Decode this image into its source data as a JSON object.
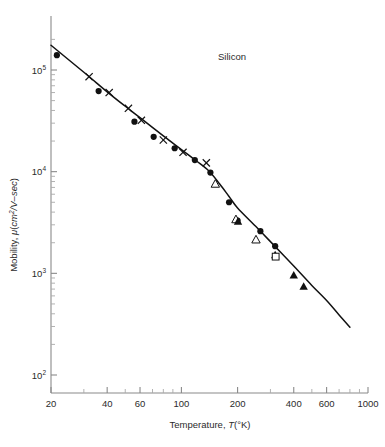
{
  "chart_data": {
    "type": "scatter",
    "title": "",
    "annotation": "Silicon",
    "xlabel": "Temperature, T(°K)",
    "ylabel": "Mobility, μ(cm²/V–sec)",
    "xscale": "log",
    "yscale": "log",
    "xlim": [
      20,
      1000
    ],
    "ylim": [
      100,
      200000
    ],
    "grid": false,
    "legend": "none",
    "xticks": [
      {
        "value": 20,
        "label": "20"
      },
      {
        "value": 40,
        "label": "40"
      },
      {
        "value": 60,
        "label": "60"
      },
      {
        "value": 100,
        "label": "100"
      },
      {
        "value": 200,
        "label": "200"
      },
      {
        "value": 400,
        "label": "400"
      },
      {
        "value": 600,
        "label": "600"
      },
      {
        "value": 1000,
        "label": "1000"
      }
    ],
    "xminorticks": [
      30,
      50,
      70,
      80,
      90,
      300,
      500,
      700,
      800,
      900
    ],
    "yticks": [
      {
        "value": 100000,
        "mantissa": "10",
        "exponent": "5"
      },
      {
        "value": 10000,
        "mantissa": "10",
        "exponent": "4"
      },
      {
        "value": 1000,
        "mantissa": "10",
        "exponent": "3"
      },
      {
        "value": 100,
        "mantissa": "10",
        "exponent": "2"
      }
    ],
    "yminorticks": [
      200,
      300,
      400,
      500,
      600,
      700,
      800,
      900,
      2000,
      3000,
      4000,
      5000,
      6000,
      7000,
      8000,
      9000,
      20000,
      30000,
      40000,
      50000,
      60000,
      70000,
      80000,
      90000,
      200000
    ],
    "series": [
      {
        "name": "filled-circle",
        "marker": "filled-circle",
        "color": "#111111",
        "points": [
          [
            21.5,
            140000
          ],
          [
            36,
            62000
          ],
          [
            56,
            31000
          ],
          [
            71,
            22000
          ],
          [
            92,
            17000
          ],
          [
            118,
            13000
          ],
          [
            143,
            9800
          ],
          [
            180,
            5000
          ],
          [
            200,
            3300
          ],
          [
            265,
            2600
          ],
          [
            318,
            1850
          ]
        ]
      },
      {
        "name": "cross",
        "marker": "cross",
        "color": "#111111",
        "points": [
          [
            32,
            86000
          ],
          [
            41,
            60000
          ],
          [
            52,
            42000
          ],
          [
            61,
            32000
          ],
          [
            80,
            20500
          ],
          [
            102,
            15500
          ],
          [
            136,
            12200
          ]
        ]
      },
      {
        "name": "open-triangle",
        "marker": "open-triangle",
        "color": "#111111",
        "points": [
          [
            152,
            7600
          ],
          [
            196,
            3400
          ],
          [
            251,
            2150
          ]
        ]
      },
      {
        "name": "filled-triangle",
        "marker": "filled-triangle",
        "color": "#111111",
        "points": [
          [
            201,
            3250
          ],
          [
            318,
            1520
          ],
          [
            400,
            960
          ],
          [
            452,
            745
          ]
        ]
      },
      {
        "name": "open-square",
        "marker": "open-square",
        "color": "#111111",
        "points": [
          [
            320,
            1460
          ]
        ]
      }
    ],
    "fit_line": {
      "name": "theoretical-curve",
      "color": "#111111",
      "points": [
        [
          20,
          175000
        ],
        [
          30,
          95000
        ],
        [
          40,
          61000
        ],
        [
          50,
          44000
        ],
        [
          60,
          34000
        ],
        [
          80,
          22500
        ],
        [
          100,
          16500
        ],
        [
          120,
          12800
        ],
        [
          140,
          10200
        ],
        [
          160,
          7600
        ],
        [
          180,
          5700
        ],
        [
          200,
          4400
        ],
        [
          250,
          2900
        ],
        [
          300,
          2050
        ],
        [
          400,
          1180
        ],
        [
          500,
          760
        ],
        [
          600,
          540
        ],
        [
          700,
          390
        ],
        [
          800,
          295
        ]
      ]
    }
  }
}
